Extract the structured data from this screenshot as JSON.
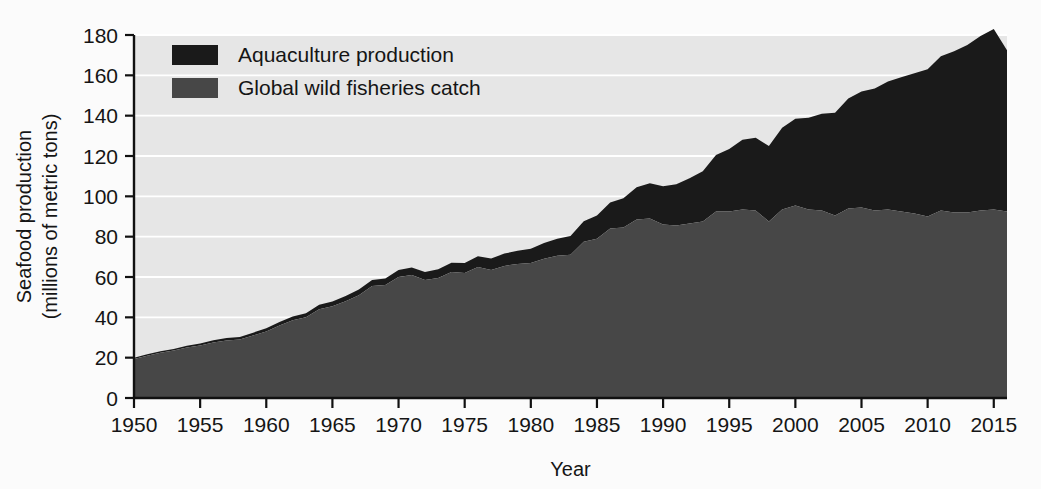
{
  "chart_data": {
    "type": "area",
    "stacked": true,
    "title": "",
    "xlabel": "Year",
    "ylabel": "Seafood production\n(millions of metric tons)",
    "ylabel_line1": "Seafood production",
    "ylabel_line2": "(millions of metric tons)",
    "xlim": [
      1950,
      2016
    ],
    "ylim": [
      0,
      180
    ],
    "y_ticks": [
      0,
      20,
      40,
      60,
      80,
      100,
      120,
      140,
      160,
      180
    ],
    "x_ticks": [
      1950,
      1955,
      1960,
      1965,
      1970,
      1975,
      1980,
      1985,
      1990,
      1995,
      2000,
      2005,
      2010,
      2015
    ],
    "grid": "horizontal",
    "legend_position": "top-left",
    "colors": {
      "aquaculture": "#1a1a1a",
      "wild": "#474747",
      "plot_background": "#e6e6e6",
      "gridline": "#ffffff",
      "axis": "#111111",
      "text": "#151515"
    },
    "series": [
      {
        "name": "Global wild fisheries catch",
        "color": "#474747",
        "stack_order": 0,
        "values": [
          19.3,
          21.0,
          22.5,
          23.5,
          25.0,
          26.0,
          27.5,
          28.5,
          29.0,
          31.0,
          33.0,
          36.0,
          38.5,
          40.0,
          44.0,
          45.5,
          48.0,
          51.0,
          55.5,
          56.0,
          60.0,
          61.0,
          58.5,
          59.5,
          62.5,
          62.0,
          65.0,
          63.5,
          65.5,
          66.5,
          67.0,
          69.0,
          70.5,
          71.0,
          77.5,
          79.0,
          84.0,
          84.5,
          88.5,
          89.0,
          86.0,
          85.5,
          86.5,
          87.5,
          92.5,
          92.5,
          93.5,
          93.0,
          87.5,
          93.5,
          95.5,
          93.5,
          93.0,
          90.5,
          94.0,
          94.5,
          93.0,
          93.5,
          92.5,
          91.5,
          90.0,
          93.0,
          92.0,
          92.0,
          93.0,
          93.5,
          92.5
        ]
      },
      {
        "name": "Aquaculture production",
        "color": "#1a1a1a",
        "stack_order": 1,
        "values": [
          0.6,
          0.7,
          0.7,
          0.8,
          0.9,
          1.0,
          1.1,
          1.2,
          1.3,
          1.4,
          1.6,
          1.7,
          1.9,
          2.0,
          2.2,
          2.4,
          2.6,
          2.8,
          3.0,
          3.2,
          3.5,
          3.7,
          4.0,
          4.3,
          4.6,
          5.0,
          5.3,
          5.7,
          6.1,
          6.5,
          7.0,
          7.8,
          8.5,
          9.3,
          10.2,
          11.5,
          13.0,
          14.5,
          16.0,
          17.5,
          19.0,
          20.5,
          22.5,
          25.0,
          28.0,
          31.0,
          34.5,
          36.0,
          37.5,
          40.5,
          43.0,
          45.5,
          48.0,
          51.0,
          54.5,
          57.5,
          60.5,
          63.5,
          66.5,
          69.5,
          73.0,
          76.5,
          80.0,
          83.0,
          86.5,
          89.5,
          80.0
        ]
      }
    ],
    "totals_note": "values run annually from 1950 to 2016"
  },
  "legend": {
    "items": [
      {
        "label": "Aquaculture production",
        "color": "#1a1a1a"
      },
      {
        "label": "Global wild fisheries catch",
        "color": "#474747"
      }
    ]
  },
  "axes": {
    "y_title_line1": "Seafood production",
    "y_title_line2": "(millions of metric tons)",
    "x_title": "Year"
  }
}
